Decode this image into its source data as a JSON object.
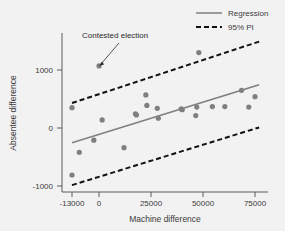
{
  "chart_data": {
    "type": "scatter",
    "title": "",
    "xlabel": "Machine difference",
    "ylabel": "Absentee difference",
    "xlim": [
      -17000,
      80000
    ],
    "ylim": [
      -1250,
      1500
    ],
    "xticks": [
      -13000,
      0,
      25000,
      50000,
      75000
    ],
    "xticklabels": [
      "-13000",
      "0",
      "25000",
      "50000",
      "75000"
    ],
    "yticks": [
      1000,
      0,
      -1000
    ],
    "yticklabels": [
      "1000",
      "0",
      "-1000"
    ],
    "grid": false,
    "legend_position": "top-right",
    "legend": [
      {
        "label": "Regression",
        "style": "solid",
        "color": "#7f7f7f"
      },
      {
        "label": "95% PI",
        "style": "dashed",
        "color": "#111111"
      }
    ],
    "annotations": [
      {
        "text": "Contested election",
        "points_to_x": 0,
        "points_to_y": 1070
      }
    ],
    "series": [
      {
        "name": "Elections",
        "type": "scatter",
        "color": "#7f7f7f",
        "points": [
          {
            "x": -13000,
            "y": -810
          },
          {
            "x": -13000,
            "y": 350
          },
          {
            "x": -9500,
            "y": -420
          },
          {
            "x": -2500,
            "y": -210
          },
          {
            "x": 0,
            "y": 1070
          },
          {
            "x": 1500,
            "y": 140
          },
          {
            "x": 12000,
            "y": -340
          },
          {
            "x": 17500,
            "y": 245
          },
          {
            "x": 18000,
            "y": 225
          },
          {
            "x": 22500,
            "y": 570
          },
          {
            "x": 23000,
            "y": 390
          },
          {
            "x": 28000,
            "y": 340
          },
          {
            "x": 28500,
            "y": 170
          },
          {
            "x": 39500,
            "y": 330
          },
          {
            "x": 40000,
            "y": 315
          },
          {
            "x": 46500,
            "y": 215
          },
          {
            "x": 47000,
            "y": 360
          },
          {
            "x": 48000,
            "y": 1300
          },
          {
            "x": 54500,
            "y": 370
          },
          {
            "x": 60500,
            "y": 370
          },
          {
            "x": 68500,
            "y": 650
          },
          {
            "x": 72000,
            "y": 360
          },
          {
            "x": 75000,
            "y": 540
          }
        ]
      },
      {
        "name": "Regression",
        "type": "line",
        "color": "#7f7f7f",
        "style": "solid",
        "x": [
          -13000,
          77000
        ],
        "y": [
          -255,
          745
        ]
      },
      {
        "name": "95% PI upper",
        "type": "line",
        "color": "#111111",
        "style": "dashed",
        "x": [
          -13000,
          77000
        ],
        "y": [
          430,
          1490
        ]
      },
      {
        "name": "95% PI lower",
        "type": "line",
        "color": "#111111",
        "style": "dashed",
        "x": [
          -13000,
          77000
        ],
        "y": [
          -985,
          10
        ]
      }
    ]
  }
}
